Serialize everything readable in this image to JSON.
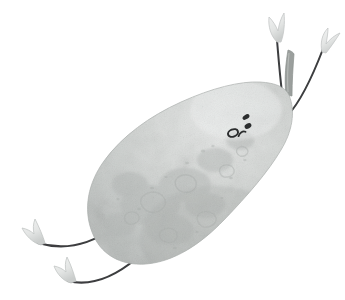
{
  "meta": {
    "domain": "Natural-Image",
    "canvas": {
      "width": 345,
      "height": 300
    },
    "background_color": "#ffffff",
    "style": "watercolor / gouache textured illustration",
    "alt_text": "A tilted grey pear character with a small face, arms raised up to the right and legs kicking down to the left."
  },
  "palette": {
    "background": "#ffffff",
    "body_light": "#e3e5e4",
    "body_mid": "#c9ccca",
    "body_shadow": "#b3b7b5",
    "body_edge": "#a7abaa",
    "texture_blotch": "#bcc0be",
    "texture_blotch_dark": "#adb1af",
    "stem_light": "#b8bcba",
    "stem_dark": "#8f9492",
    "limb_stroke": "#3c3e3f",
    "hand_fill": "#e8eae9",
    "hand_edge": "#c4c7c6",
    "face_mark": "#2b2d2e"
  },
  "subject": {
    "name": "pear",
    "orientation": "tilted diagonally, narrow top end toward upper right",
    "body": {
      "label": "pear body",
      "center_x": 180,
      "center_y": 175,
      "rotation_deg": -38,
      "radius_x": 62,
      "radius_y": 108,
      "surface": "mottled, blotchy watercolor wash"
    },
    "stem": {
      "label": "stem",
      "from": [
        291,
        92
      ],
      "to": [
        288,
        50
      ],
      "width": 7,
      "color": "#8f9492"
    },
    "face": {
      "label": "face",
      "expression": "simple dot face",
      "marks": [
        {
          "name": "eye-left",
          "shape": "ring",
          "cx": 233,
          "cy": 133,
          "rx": 5.2,
          "ry": 3.6,
          "rotation_deg": -22
        },
        {
          "name": "eye-right",
          "shape": "oval",
          "cx": 247,
          "cy": 126,
          "rx": 3.4,
          "ry": 2.4,
          "rotation_deg": -28
        },
        {
          "name": "brow-mark",
          "shape": "oval",
          "cx": 245,
          "cy": 118,
          "rx": 3.6,
          "ry": 2.2,
          "rotation_deg": -30
        },
        {
          "name": "mouth-mark",
          "shape": "arc",
          "cx": 241,
          "cy": 133,
          "rx": 4.0,
          "ry": 2.6,
          "rotation_deg": -20
        }
      ]
    },
    "arms": [
      {
        "name": "arm-upper-left",
        "path": "M 283,112 C 279,92 278,62 277,38",
        "hand": {
          "name": "hand-leaf-upper-left",
          "tip": [
            272,
            16
          ],
          "base": [
            279,
            42
          ],
          "rotation_deg": 8
        }
      },
      {
        "name": "arm-upper-right",
        "path": "M 287,114 C 300,100 313,72 324,46",
        "hand": {
          "name": "hand-leaf-upper-right",
          "tip": [
            328,
            30
          ],
          "base": [
            322,
            52
          ],
          "rotation_deg": -22
        }
      }
    ],
    "legs": [
      {
        "name": "leg-upper-left",
        "path": "M 113,228 C 88,246 62,250 38,243",
        "foot": {
          "name": "foot-wedge-upper",
          "tip": [
            22,
            228
          ],
          "base": [
            40,
            245
          ],
          "rotation_deg": 16
        }
      },
      {
        "name": "leg-lower-left",
        "path": "M 137,258 C 110,278 86,285 68,281",
        "foot": {
          "name": "foot-wedge-lower",
          "tip": [
            55,
            265
          ],
          "base": [
            70,
            283
          ],
          "rotation_deg": 16
        }
      }
    ]
  }
}
